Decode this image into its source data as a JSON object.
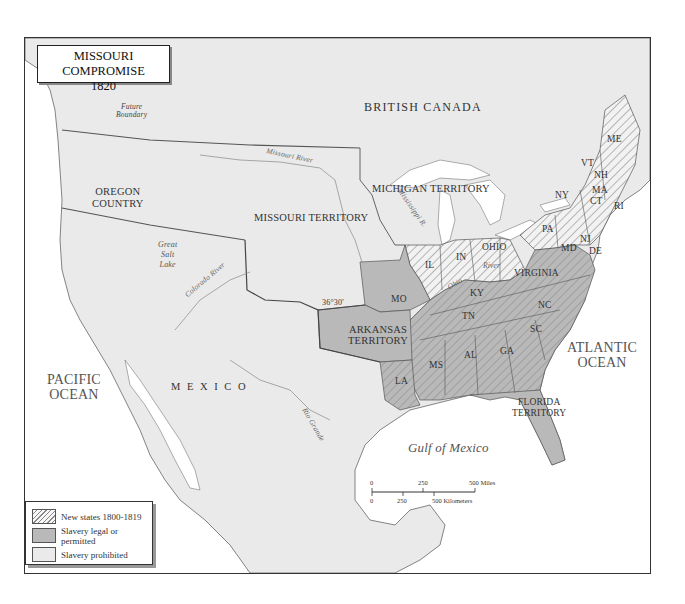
{
  "title": {
    "line1": "MISSOURI COMPROMISE",
    "line2": "1820"
  },
  "colors": {
    "slave": "#b9b9b9",
    "free": "#eaeaea",
    "water": "#ffffff",
    "border": "#333333",
    "hatch": "#888888"
  },
  "legend": [
    {
      "swatch": "hatch",
      "label": "New states 1800-1819"
    },
    {
      "swatch": "dark",
      "label": "Slavery legal or permitted"
    },
    {
      "swatch": "light",
      "label": "Slavery prohibited"
    }
  ],
  "regions": {
    "british_canada": "BRITISH CANADA",
    "oregon": [
      "OREGON",
      "COUNTRY"
    ],
    "missouri_territory": "MISSOURI TERRITORY",
    "michigan_territory": "MICHIGAN TERRITORY",
    "arkansas_territory": [
      "ARKANSAS",
      "TERRITORY"
    ],
    "florida_territory": [
      "FLORIDA",
      "TERRITORY"
    ],
    "mexico": "M E X I C O"
  },
  "states": {
    "me": "ME",
    "vt": "VT",
    "nh": "NH",
    "ma": "MA",
    "ct": "CT",
    "ri": "RI",
    "ny": "NY",
    "pa": "PA",
    "nj": "NJ",
    "de": "DE",
    "md": "MD",
    "oh": "OHIO",
    "in": "IN",
    "il": "IL",
    "ky": "KY",
    "va": "VIRGINIA",
    "nc": "NC",
    "sc": "SC",
    "tn": "TN",
    "ga": "GA",
    "al": "AL",
    "ms": "MS",
    "la": "LA",
    "mo": "MO"
  },
  "water": {
    "pacific": [
      "PACIFIC",
      "OCEAN"
    ],
    "atlantic": [
      "ATLANTIC",
      "OCEAN"
    ],
    "gulf": "Gulf of Mexico",
    "great_salt_lake": [
      "Great",
      "Salt",
      "Lake"
    ]
  },
  "rivers": {
    "missouri": "Missouri River",
    "mississippi": "Mississippi R.",
    "colorado": "Colorado River",
    "rio_grande": "Rio Grande",
    "ohio": "River",
    "ohio2": "Ohio"
  },
  "annotations": {
    "future_boundary": [
      "Future",
      "Boundary"
    ],
    "parallel": "36°30'"
  },
  "scale": {
    "miles": [
      "0",
      "250",
      "500 Miles"
    ],
    "km": [
      "0",
      "250",
      "500 Kilometers"
    ]
  }
}
